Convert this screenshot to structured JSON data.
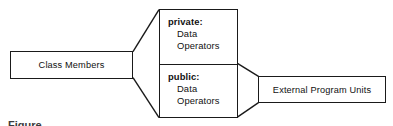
{
  "diagram": {
    "type": "block-diagram",
    "background_color": "#ffffff",
    "line_color": "#1a1a1a",
    "text_color": "#111111",
    "left_node": {
      "label": "Class Members"
    },
    "center_node": {
      "sections": [
        {
          "title": "private:",
          "members": [
            "Data",
            "Operators"
          ]
        },
        {
          "title": "public:",
          "members": [
            "Data",
            "Operators"
          ]
        }
      ]
    },
    "right_node": {
      "label": "External Program Units"
    },
    "connectors": [
      {
        "name": "class-members-to-private",
        "from": "class-members-box-top-right",
        "to": "private-section-top-left"
      },
      {
        "name": "class-members-to-public",
        "from": "class-members-box-bottom-right",
        "to": "public-section-bottom-left"
      },
      {
        "name": "public-top-to-external-units",
        "from": "center-node-divider-right",
        "to": "external-units-box-top-left"
      },
      {
        "name": "public-bottom-to-external-units",
        "from": "center-node-bottom-right",
        "to": "external-units-box-bottom-left"
      }
    ],
    "caption": {
      "text": "Figure"
    }
  }
}
